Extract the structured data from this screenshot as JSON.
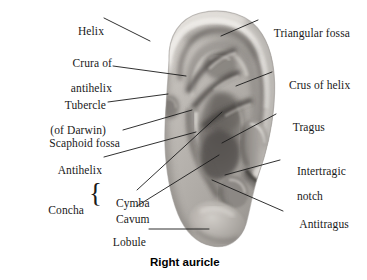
{
  "figure": {
    "caption": "Right auricle",
    "background_color": "#ffffff",
    "line_color": "#1a1a1a",
    "text_color": "#1a1a1a"
  },
  "labels_left": [
    {
      "id": "helix",
      "text": "Helix",
      "text2": ""
    },
    {
      "id": "crura",
      "text": "Crura of",
      "text2": "antihelix"
    },
    {
      "id": "tubercle",
      "text": "Tubercle",
      "text2": "(of Darwin)"
    },
    {
      "id": "scaphoid-fossa",
      "text": "Scaphoid fossa",
      "text2": ""
    },
    {
      "id": "antihelix",
      "text": "Antihelix",
      "text2": ""
    },
    {
      "id": "concha",
      "text": "Concha",
      "text2": ""
    },
    {
      "id": "cymba",
      "text": "Cymba",
      "text2": ""
    },
    {
      "id": "cavum",
      "text": "Cavum",
      "text2": ""
    },
    {
      "id": "lobule",
      "text": "Lobule",
      "text2": ""
    }
  ],
  "labels_right": [
    {
      "id": "triangular-fossa",
      "text": "Triangular fossa",
      "text2": ""
    },
    {
      "id": "crus-of-helix",
      "text": "Crus of helix",
      "text2": ""
    },
    {
      "id": "tragus",
      "text": "Tragus",
      "text2": ""
    },
    {
      "id": "intertragic-notch",
      "text": "Intertragic",
      "text2": "notch"
    },
    {
      "id": "antitragus",
      "text": "Antitragus",
      "text2": ""
    }
  ],
  "brace": {
    "glyph": "{"
  }
}
